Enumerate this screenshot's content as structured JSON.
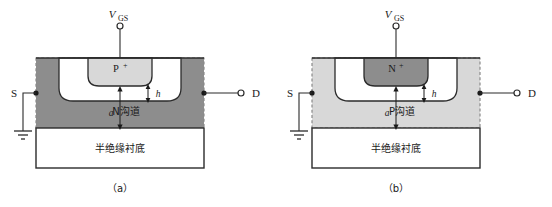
{
  "figure": {
    "type": "diagram",
    "colors": {
      "dark_gray": "#8d8d8d",
      "light_gray": "#d8d8d8",
      "white": "#ffffff",
      "outline": "#2b2b2b",
      "dashed_border": "#8a8a8a"
    }
  },
  "panel_a": {
    "caption": "（a）",
    "gate_voltage_label": "V",
    "gate_voltage_sub": "GS",
    "gate_region_label": "P",
    "gate_region_sup": "+",
    "channel_label": "N沟道",
    "substrate_label": "半绝缘衬底",
    "source_label": "S",
    "drain_label": "D",
    "dim_a": "a",
    "dim_h": "h",
    "channel_fill": "#8d8d8d",
    "gate_fill": "#d8d8d8",
    "depletion_fill": "#ffffff"
  },
  "panel_b": {
    "caption": "（b）",
    "gate_voltage_label": "V",
    "gate_voltage_sub": "GS",
    "gate_region_label": "N",
    "gate_region_sup": "+",
    "channel_label": "P沟道",
    "substrate_label": "半绝缘衬底",
    "source_label": "S",
    "drain_label": "D",
    "dim_a": "a",
    "dim_h": "h",
    "channel_fill": "#d8d8d8",
    "gate_fill": "#8d8d8d",
    "depletion_fill": "#ffffff"
  }
}
